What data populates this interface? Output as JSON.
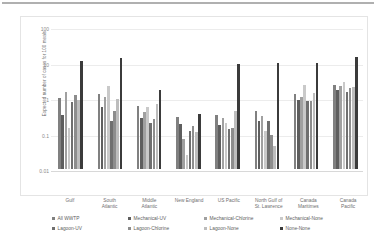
{
  "chart_data": {
    "type": "bar",
    "title": "",
    "xlabel": "",
    "ylabel": "Expected number of cases for 100 meals",
    "yscale": "log",
    "ylim": [
      0.01,
      100
    ],
    "yticks": [
      0.01,
      0.1,
      1,
      10,
      100
    ],
    "ytick_labels": [
      "0.01",
      "0.1",
      "1",
      "10",
      "100"
    ],
    "grid": true,
    "legend_position": "bottom",
    "categories": [
      "Gulf",
      "South Atlantic",
      "Middle Atlantic",
      "New England",
      "US Pacific",
      "North Gulf of St. Lawrence",
      "Canada Maritimes",
      "Canada Pacific"
    ],
    "category_lines": [
      [
        "Gulf"
      ],
      [
        "South",
        "Atlantic"
      ],
      [
        "Middle",
        "Atlantic"
      ],
      [
        "New England"
      ],
      [
        "US Pacific"
      ],
      [
        "North Gulf of",
        "St. Lawrence"
      ],
      [
        "Canada",
        "Maritimes"
      ],
      [
        "Canada",
        "Pacific"
      ]
    ],
    "series": [
      {
        "name": "All WWTP",
        "color": "#808080",
        "values": [
          1.0,
          1.3,
          0.6,
          0.3,
          0.34,
          0.43,
          1.3,
          2.4
        ]
      },
      {
        "name": "Mechanical-UV",
        "color": "#5e5e5e",
        "values": [
          0.33,
          0.55,
          0.28,
          0.19,
          0.17,
          0.23,
          0.9,
          1.7
        ]
      },
      {
        "name": "Mechanical-Chlorine",
        "color": "#a0a0a0",
        "values": [
          1.5,
          1.1,
          0.4,
          0.07,
          0.28,
          0.32,
          1.1,
          2.2
        ]
      },
      {
        "name": "Mechanical-None",
        "color": "#c9c9c9",
        "values": [
          0.14,
          2.2,
          0.55,
          0.025,
          0.2,
          0.12,
          2.4,
          2.9
        ]
      },
      {
        "name": "Lagoon-UV",
        "color": "#6f6f6f",
        "values": [
          0.75,
          0.22,
          0.2,
          0.12,
          0.13,
          0.23,
          0.8,
          1.5
        ]
      },
      {
        "name": "Lagoon-Chlorine",
        "color": "#8d8d8d",
        "values": [
          1.2,
          0.42,
          0.26,
          0.16,
          0.14,
          0.09,
          0.85,
          1.9
        ]
      },
      {
        "name": "Lagoon-None",
        "color": "#bdbdbd",
        "values": [
          0.9,
          0.95,
          0.7,
          0.11,
          0.42,
          0.045,
          1.4,
          2.0
        ]
      },
      {
        "name": "None-None",
        "color": "#3b3b3b",
        "values": [
          11.0,
          13.0,
          1.7,
          0.36,
          9.0,
          9.5,
          9.5,
          14.0
        ]
      }
    ]
  }
}
